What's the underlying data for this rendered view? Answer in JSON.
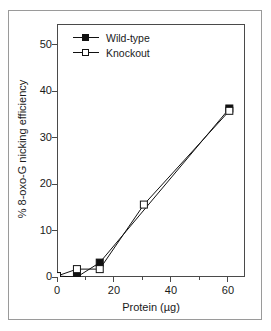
{
  "chart_data": {
    "type": "line",
    "title": "",
    "xlabel": "Protein (µg)",
    "ylabel": "% 8-oxo-G nicking efficiency",
    "xlim": [
      0,
      66
    ],
    "ylim": [
      0,
      54.5
    ],
    "xticks": [
      0,
      20,
      40,
      60
    ],
    "xtick_labels": [
      "0",
      "20",
      "40",
      "60"
    ],
    "yticks": [
      0,
      10,
      20,
      30,
      40,
      50
    ],
    "ytick_labels": [
      "0",
      "10",
      "20",
      "30",
      "40",
      "50"
    ],
    "grid": false,
    "legend_position": "top-left",
    "series": [
      {
        "name": "Wild-type",
        "marker": "filled-square",
        "color": "#111111",
        "x": [
          0,
          7,
          15,
          60.5
        ],
        "y": [
          0.2,
          0.0,
          3.1,
          36.3
        ]
      },
      {
        "name": "Knockout",
        "marker": "open-square",
        "color": "#111111",
        "x": [
          0,
          7,
          15,
          30.5,
          60.5
        ],
        "y": [
          0.2,
          1.7,
          1.7,
          15.6,
          35.8
        ]
      }
    ]
  },
  "legend": {
    "items": [
      {
        "label": "Wild-type",
        "marker": "filled-square"
      },
      {
        "label": "Knockout",
        "marker": "open-square"
      }
    ]
  },
  "colors": {
    "line": "#111111",
    "axis": "#4a4a4a",
    "outer_frame": "#9a9a9a",
    "background": "#ffffff",
    "text": "#1a1a1a"
  }
}
